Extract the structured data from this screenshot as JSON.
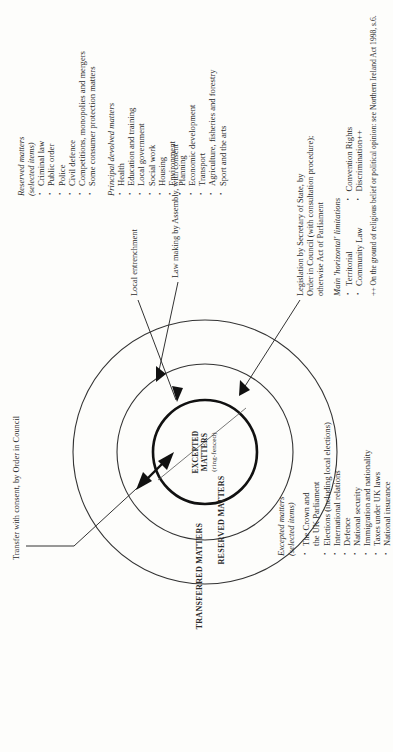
{
  "figure": {
    "top_caption": "Transfer with consent, by Order in Council",
    "circles": {
      "outer_label": "TRANSFERRED MATTERS",
      "middle_label": "RESERVED MATTERS",
      "inner_label_line1": "EXCEPTED",
      "inner_label_line2": "MATTERS",
      "inner_label_line3": "(ring-fenced)"
    },
    "annotations": {
      "local_entrenchment": "Local entrenchment",
      "law_making": "Law making by Assembly, with consent",
      "legislation_line1": "Legislation by Secretary of State, by",
      "legislation_line2": "Order in Council (with consultation procedure);",
      "legislation_line3": "otherwise Act of Parliament"
    },
    "footnote": "++ On the ground of religious belief or political opinion:  see Northern Ireland Act 1998, s.6."
  },
  "excepted": {
    "heading": "Excepted matters",
    "subheading": "(selected items)",
    "items": [
      "The Crown and",
      "the UK Parliament",
      "Elections (including local elections)",
      "International relations",
      "Defence",
      "National security",
      "Immigration and nationality",
      "Taxes under UK laws",
      "National insurance"
    ]
  },
  "reserved": {
    "heading": "Reserved matters",
    "subheading": "(selected items)",
    "items": [
      "Criminal law",
      "Public order",
      "Police",
      "Civil defence",
      "Competitions, monopolies and mergers",
      "Some consumer protection matters"
    ]
  },
  "devolved": {
    "heading": "Principal devolved matters",
    "items": [
      "Health",
      "Education and training",
      "Local government",
      "Social work",
      "Housing",
      "Environment",
      "Planning",
      "Economic development",
      "Transport",
      "Agriculture, fisheries and forestry",
      "Sport and the arts"
    ]
  },
  "limitations": {
    "heading": "Main 'horizontal' limitations",
    "items": [
      "Territorial",
      "Convention Rights",
      "Community Law",
      "Discrimination++"
    ]
  },
  "colors": {
    "ink": "#2b2b2b",
    "paper": "#fdfdfb",
    "stroke": "#333333"
  }
}
